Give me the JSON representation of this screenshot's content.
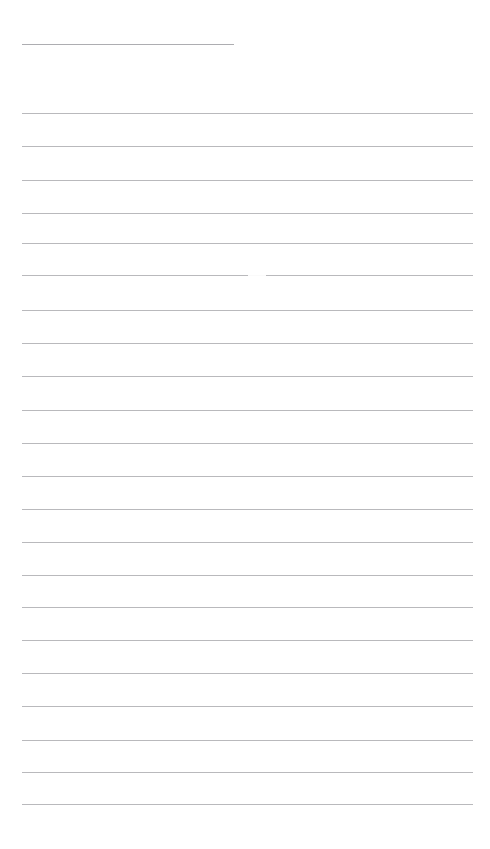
{
  "page": {
    "kind": "ruled-paper",
    "width": 490,
    "height": 849,
    "background_color": "#ffffff",
    "content_text": "",
    "title_text": "",
    "notes_text": ""
  },
  "style": {
    "rule_color": "#b9b9bc",
    "title_rule_color": "#adadb1",
    "rule_thickness": 1,
    "rule_spacing": 33.3,
    "margin_left": 22,
    "margin_right": 473,
    "first_rule_y": 44,
    "last_rule_y": 804
  },
  "rules": [
    {
      "id": "title-rule",
      "y": 44,
      "x1": 22,
      "x2": 234,
      "full_width": false,
      "color": "#adadb1"
    },
    {
      "id": "rule-01",
      "y": 113,
      "x1": 22,
      "x2": 473,
      "full_width": true,
      "color": "#b9b9bc"
    },
    {
      "id": "rule-02",
      "y": 146,
      "x1": 22,
      "x2": 473,
      "full_width": true,
      "color": "#b9b9bc"
    },
    {
      "id": "rule-03",
      "y": 180,
      "x1": 22,
      "x2": 473,
      "full_width": true,
      "color": "#b9b9bc"
    },
    {
      "id": "rule-04",
      "y": 213,
      "x1": 22,
      "x2": 473,
      "full_width": true,
      "color": "#b9b9bc"
    },
    {
      "id": "rule-05",
      "y": 243,
      "x1": 22,
      "x2": 473,
      "full_width": true,
      "color": "#b9b9bc"
    },
    {
      "id": "rule-06",
      "y": 275,
      "x1": 22,
      "x2": 473,
      "full_width": true,
      "color": "#b9b9bc"
    },
    {
      "id": "rule-07",
      "y": 310,
      "x1": 22,
      "x2": 473,
      "full_width": true,
      "color": "#b9b9bc"
    },
    {
      "id": "rule-08",
      "y": 343,
      "x1": 22,
      "x2": 473,
      "full_width": true,
      "color": "#b9b9bc"
    },
    {
      "id": "rule-09",
      "y": 376,
      "x1": 22,
      "x2": 473,
      "full_width": true,
      "color": "#b9b9bc"
    },
    {
      "id": "rule-10",
      "y": 410,
      "x1": 22,
      "x2": 473,
      "full_width": true,
      "color": "#b9b9bc"
    },
    {
      "id": "rule-11",
      "y": 443,
      "x1": 22,
      "x2": 473,
      "full_width": true,
      "color": "#b9b9bc"
    },
    {
      "id": "rule-12",
      "y": 476,
      "x1": 22,
      "x2": 473,
      "full_width": true,
      "color": "#b9b9bc"
    },
    {
      "id": "rule-13",
      "y": 509,
      "x1": 22,
      "x2": 473,
      "full_width": true,
      "color": "#b9b9bc"
    },
    {
      "id": "rule-14",
      "y": 542,
      "x1": 22,
      "x2": 473,
      "full_width": true,
      "color": "#b9b9bc"
    },
    {
      "id": "rule-15",
      "y": 575,
      "x1": 22,
      "x2": 473,
      "full_width": true,
      "color": "#b9b9bc"
    },
    {
      "id": "rule-16",
      "y": 607,
      "x1": 22,
      "x2": 473,
      "full_width": true,
      "color": "#b9b9bc"
    },
    {
      "id": "rule-17",
      "y": 640,
      "x1": 22,
      "x2": 473,
      "full_width": true,
      "color": "#b9b9bc"
    },
    {
      "id": "rule-18",
      "y": 673,
      "x1": 22,
      "x2": 473,
      "full_width": true,
      "color": "#b9b9bc"
    },
    {
      "id": "rule-19",
      "y": 706,
      "x1": 22,
      "x2": 473,
      "full_width": true,
      "color": "#b9b9bc"
    },
    {
      "id": "rule-20",
      "y": 740,
      "x1": 22,
      "x2": 473,
      "full_width": true,
      "color": "#b9b9bc"
    },
    {
      "id": "rule-21",
      "y": 772,
      "x1": 22,
      "x2": 473,
      "full_width": true,
      "color": "#b9b9bc"
    },
    {
      "id": "rule-22",
      "y": 804,
      "x1": 22,
      "x2": 473,
      "full_width": true,
      "color": "#b9b9bc"
    }
  ],
  "rule_breaks": [
    {
      "on_rule": "rule-06",
      "y": 274,
      "x1": 248,
      "x2": 266
    }
  ],
  "regions": {
    "header_blank": {
      "y": 0,
      "height": 44,
      "text": ""
    },
    "title_gap": {
      "y": 45,
      "height": 67,
      "text": ""
    },
    "footer_blank": {
      "y": 806,
      "height": 43,
      "text": ""
    }
  }
}
